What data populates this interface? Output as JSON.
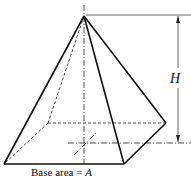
{
  "diagram": {
    "type": "square pyramid",
    "labels": {
      "height": "H",
      "base_prefix": "Base area = ",
      "base_var": "A"
    },
    "points": {
      "apex": [
        84,
        16
      ],
      "front_left": [
        4,
        164
      ],
      "front_right": [
        124,
        164
      ],
      "back_right": [
        166,
        123
      ],
      "back_left": [
        48,
        123
      ],
      "base_center": [
        85,
        143
      ]
    },
    "colors": {
      "stroke": "#111111",
      "background": "#ffffff"
    }
  }
}
